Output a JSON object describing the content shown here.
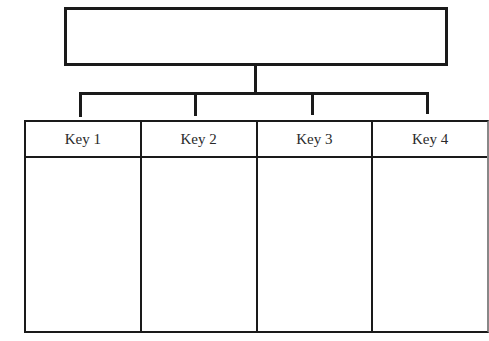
{
  "diagram": {
    "type": "hierarchy / key chart",
    "top_box": {
      "label": ""
    },
    "columns": [
      {
        "key": "Key 1",
        "content": ""
      },
      {
        "key": "Key 2",
        "content": ""
      },
      {
        "key": "Key 3",
        "content": ""
      },
      {
        "key": "Key 4",
        "content": ""
      }
    ],
    "colors": {
      "line": "#1a1a1a",
      "background": "#ffffff",
      "text": "#2a2a2a"
    }
  }
}
